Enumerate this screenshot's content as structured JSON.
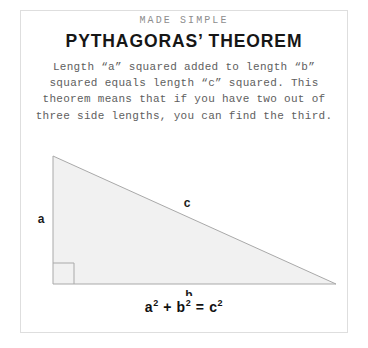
{
  "card": {
    "eyebrow": "MADE SIMPLE",
    "title": "PYTHAGORAS’ THEOREM",
    "body": "Length “a” squared added to length “b” squared equals length “c” squared. This theorem means that if you have two out of three side lengths, you can find the third.",
    "formula": {
      "base_a": "a",
      "exp_a": "2",
      "plus": " + ",
      "base_b": "b",
      "exp_b": "2",
      "equals": " = ",
      "base_c": "c",
      "exp_c": "2"
    }
  },
  "diagram": {
    "type": "right-triangle",
    "labels": {
      "vertical_leg": "a",
      "horizontal_leg": "b",
      "hypotenuse": "c"
    },
    "right_angle_marker": "right-angle-square",
    "colors": {
      "fill": "#f1f1f1",
      "stroke": "#a9a9a9",
      "card_border": "#dedede",
      "title_text": "#161616",
      "body_text": "#5e5e5e",
      "eyebrow_text": "#8d8d8d"
    }
  }
}
